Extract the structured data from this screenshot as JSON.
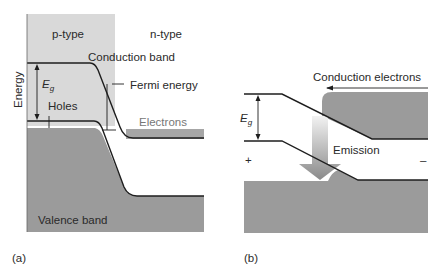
{
  "panel_a": {
    "caption": "(a)",
    "region_left": "p-type",
    "region_right": "n-type",
    "axis_label": "Energy",
    "conduction_band": "Conduction band",
    "valence_band": "Valence band",
    "gap_symbol": "E",
    "gap_subscript": "g",
    "holes": "Holes",
    "fermi": "Fermi energy",
    "electrons": "Electrons"
  },
  "panel_b": {
    "caption": "(b)",
    "conduction_electrons": "Conduction electrons",
    "gap_symbol": "E",
    "gap_subscript": "g",
    "emission": "Emission",
    "plus": "+",
    "minus": "–"
  },
  "colors": {
    "p_region": "#d8d8d8",
    "band_fill": "#9a9a9a",
    "electron_fill": "#a8a8a8",
    "line": "#1e1e1e"
  }
}
